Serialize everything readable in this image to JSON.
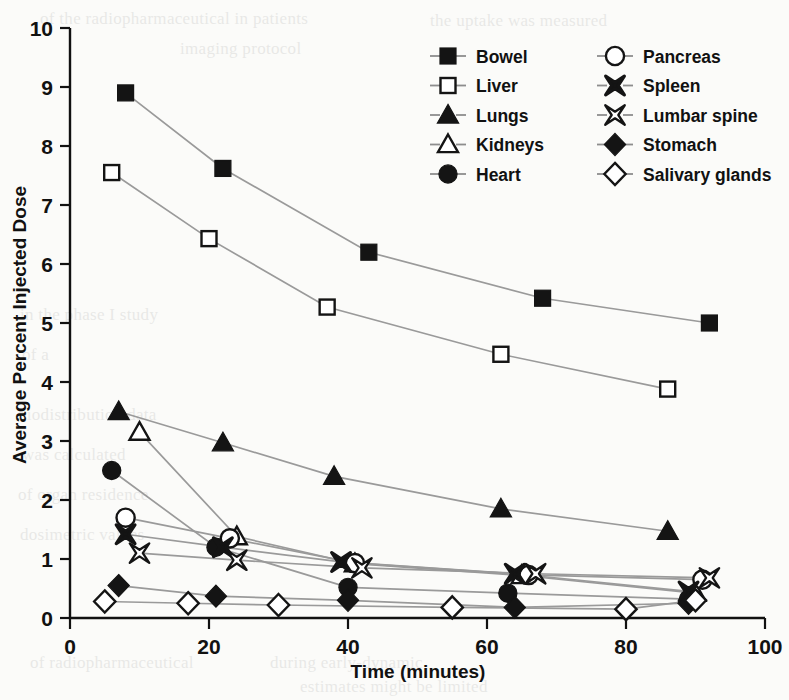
{
  "chart_data": {
    "type": "line",
    "title": "",
    "xlabel": "Time (minutes)",
    "ylabel": "Average Percent Injected Dose",
    "xlim": [
      0,
      100
    ],
    "ylim": [
      0,
      10
    ],
    "xticks": [
      0,
      20,
      40,
      60,
      80,
      100
    ],
    "yticks": [
      0,
      1,
      2,
      3,
      4,
      5,
      6,
      7,
      8,
      9,
      10
    ],
    "grid": false,
    "legend_position": "top-right",
    "legend_columns": 2,
    "series": [
      {
        "name": "Bowel",
        "marker": "filled-square",
        "x": [
          8,
          22,
          43,
          68,
          92
        ],
        "y": [
          8.9,
          7.62,
          6.2,
          5.42,
          5.0
        ]
      },
      {
        "name": "Liver",
        "marker": "open-square",
        "x": [
          6,
          20,
          37,
          62,
          86
        ],
        "y": [
          7.55,
          6.43,
          5.27,
          4.47,
          3.88
        ]
      },
      {
        "name": "Lungs",
        "marker": "filled-triangle",
        "x": [
          7,
          22,
          38,
          62,
          86
        ],
        "y": [
          3.5,
          2.97,
          2.4,
          1.85,
          1.47
        ]
      },
      {
        "name": "Kidneys",
        "marker": "open-triangle",
        "x": [
          10,
          24,
          41,
          65,
          90
        ],
        "y": [
          3.15,
          1.38,
          0.92,
          0.72,
          0.42
        ]
      },
      {
        "name": "Heart",
        "marker": "filled-circle",
        "x": [
          6,
          21,
          40,
          63,
          89
        ],
        "y": [
          2.5,
          1.2,
          0.52,
          0.42,
          0.32
        ]
      },
      {
        "name": "Pancreas",
        "marker": "open-circle",
        "x": [
          8,
          23,
          41,
          66,
          91
        ],
        "y": [
          1.7,
          1.35,
          0.93,
          0.73,
          0.65
        ]
      },
      {
        "name": "Spleen",
        "marker": "bold-x",
        "x": [
          8,
          22,
          39,
          64,
          89
        ],
        "y": [
          1.42,
          1.2,
          0.95,
          0.75,
          0.45
        ]
      },
      {
        "name": "Lumbar spine",
        "marker": "open-x",
        "x": [
          10,
          24,
          42,
          67,
          92
        ],
        "y": [
          1.1,
          0.98,
          0.85,
          0.75,
          0.68
        ]
      },
      {
        "name": "Stomach",
        "marker": "filled-diamond",
        "x": [
          7,
          21,
          40,
          64,
          89
        ],
        "y": [
          0.55,
          0.37,
          0.3,
          0.18,
          0.25
        ]
      },
      {
        "name": "Salivary glands",
        "marker": "open-diamond",
        "x": [
          5,
          17,
          30,
          55,
          80,
          90
        ],
        "y": [
          0.28,
          0.25,
          0.22,
          0.18,
          0.15,
          0.3
        ]
      }
    ]
  },
  "legend": {
    "column_1": [
      "Bowel",
      "Liver",
      "Lungs",
      "Kidneys",
      "Heart"
    ],
    "column_2": [
      "Pancreas",
      "Spleen",
      "Lumbar spine",
      "Stomach",
      "Salivary glands"
    ]
  },
  "colors": {
    "marker_fill": "#141414",
    "marker_open": "#ffffff",
    "line": "#9a9a9a",
    "axis": "#111111",
    "background": "#fbfbf9"
  },
  "background_text": {
    "lines": [
      "of the radiopharmaceutical in patients",
      "the uptake was measured",
      "imaging protocol",
      "in the phase I study",
      "of a",
      "biodistribution data",
      "was calculated",
      "of organ residence",
      "dosimetric values",
      "during early-dynamic",
      "of radiopharmaceutical",
      "estimates might be limited"
    ]
  }
}
